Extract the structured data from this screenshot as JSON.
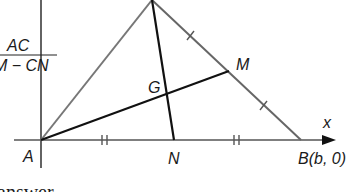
{
  "figure": {
    "points": {
      "A": {
        "label": "A",
        "x": 41,
        "y": 140
      },
      "C": {
        "label": "",
        "x": 152,
        "y": 0
      },
      "B": {
        "label": "B(b, 0)",
        "x": 301,
        "y": 140
      },
      "M": {
        "label": "M",
        "x": 229,
        "y": 71
      },
      "N": {
        "label": "N",
        "x": 174,
        "y": 140
      },
      "G": {
        "label": "G",
        "x": 168,
        "y": 94
      }
    },
    "axis_x_label": "x",
    "fraction": {
      "numerator": "AC",
      "denominator": "M − CN"
    },
    "footer_text": "answer",
    "colors": {
      "line_dark": "#111111",
      "line_gray": "#777777",
      "text": "#1a1a1a"
    }
  }
}
